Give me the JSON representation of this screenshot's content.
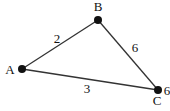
{
  "diagram": {
    "type": "weighted-graph",
    "nodes": [
      {
        "id": "A",
        "label": "A",
        "x": 22,
        "y": 69,
        "lx": 10,
        "ly": 74
      },
      {
        "id": "B",
        "label": "B",
        "x": 98,
        "y": 20,
        "lx": 98,
        "ly": 11
      },
      {
        "id": "C",
        "label": "C",
        "x": 158,
        "y": 90,
        "lx": 157,
        "ly": 105
      }
    ],
    "edges": [
      {
        "from": "A",
        "to": "B",
        "weight": "2",
        "lx": 57,
        "ly": 43
      },
      {
        "from": "B",
        "to": "C",
        "weight": "6",
        "lx": 135,
        "ly": 52
      },
      {
        "from": "A",
        "to": "C",
        "weight": "3",
        "lx": 87,
        "ly": 93
      }
    ],
    "node_annotations": [
      {
        "node": "C",
        "text": "6",
        "lx": 167,
        "ly": 95
      }
    ],
    "colors": {
      "line": "#333333",
      "node": "#111111",
      "text": "#111111"
    }
  }
}
